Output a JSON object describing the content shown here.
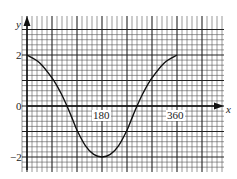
{
  "chart_data": {
    "type": "line",
    "title": "",
    "xlabel": "x",
    "ylabel": "y",
    "x_tick_labels": [
      "180",
      "360"
    ],
    "y_tick_labels": [
      "2",
      "0",
      "−2"
    ],
    "xlim": [
      0,
      470
    ],
    "ylim": [
      -2.6,
      3.5
    ],
    "grid": true,
    "grid_major_x": 60,
    "grid_minor_x": 12,
    "grid_major_y": 1,
    "grid_minor_y": 0.2,
    "series": [
      {
        "name": "curve",
        "x": [
          0,
          30,
          60,
          80,
          96,
          110,
          120,
          140,
          160,
          180,
          200,
          220,
          240,
          250,
          264,
          280,
          300,
          330,
          360
        ],
        "y": [
          2.0,
          1.7,
          1.1,
          0.55,
          0.0,
          -0.55,
          -0.95,
          -1.55,
          -1.9,
          -2.0,
          -1.9,
          -1.55,
          -0.95,
          -0.55,
          0.0,
          0.55,
          1.1,
          1.7,
          2.0
        ]
      }
    ]
  },
  "labels": {
    "y_axis": "y",
    "x_axis": "x",
    "y_2": "2",
    "y_0": "0",
    "y_neg2": "−2",
    "x_180": "180",
    "x_360": "360"
  }
}
